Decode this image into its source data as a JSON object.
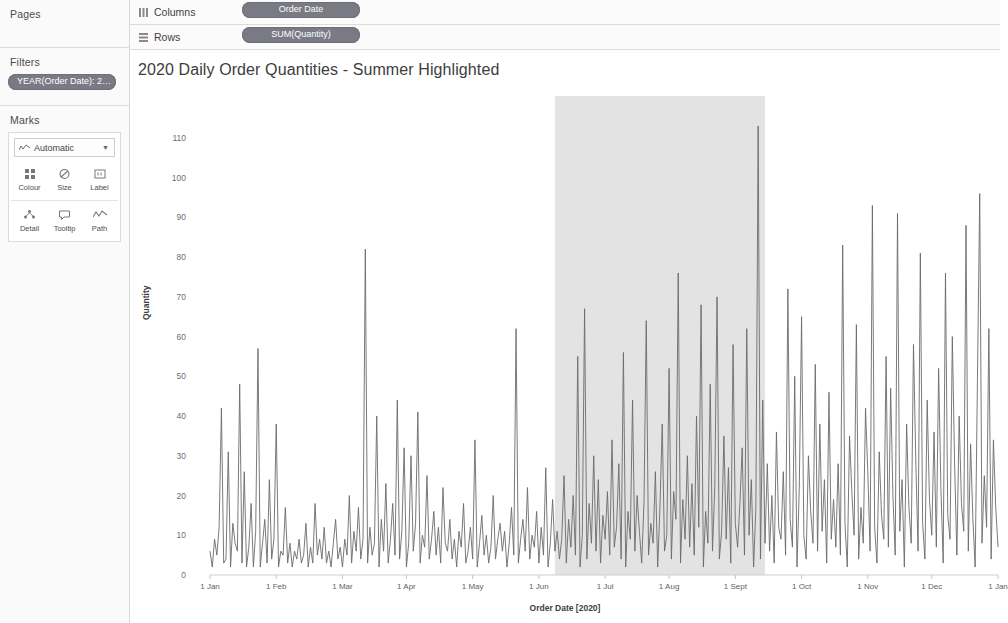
{
  "sidebar": {
    "pages": {
      "title": "Pages"
    },
    "filters": {
      "title": "Filters",
      "pills": [
        {
          "label": "YEAR(Order Date): 2…"
        }
      ]
    },
    "marks": {
      "title": "Marks",
      "type_selector": {
        "value": "Automatic",
        "icon": "line-mark-icon",
        "caret": "chevron-down-icon"
      },
      "buttons": [
        {
          "label": "Colour",
          "icon": "colour-icon"
        },
        {
          "label": "Size",
          "icon": "size-icon"
        },
        {
          "label": "Label",
          "icon": "label-icon"
        },
        {
          "label": "Detail",
          "icon": "detail-icon"
        },
        {
          "label": "Tooltip",
          "icon": "tooltip-icon"
        },
        {
          "label": "Path",
          "icon": "path-icon"
        }
      ]
    }
  },
  "shelves": [
    {
      "name": "Columns",
      "icon": "columns-icon",
      "pill": "Order Date"
    },
    {
      "name": "Rows",
      "icon": "rows-icon",
      "pill": "SUM(Quantity)"
    }
  ],
  "viz": {
    "title": "2020 Daily Order Quantities - Summer Highlighted",
    "band": {
      "label": "Summer",
      "start": "1 Jun",
      "end": "1 Sept",
      "color": "#e3e3e3"
    },
    "line_color": "#6b6b6b"
  },
  "chart_data": {
    "type": "line",
    "title": "2020 Daily Order Quantities - Summer Highlighted",
    "xlabel": "Order Date [2020]",
    "ylabel": "Quantity",
    "ylim": [
      0,
      115
    ],
    "yticks": [
      0,
      10,
      20,
      30,
      40,
      50,
      60,
      70,
      80,
      90,
      100,
      110
    ],
    "xticks": [
      "1 Jan",
      "1 Feb",
      "1 Mar",
      "1 Apr",
      "1 May",
      "1 Jun",
      "1 Jul",
      "1 Aug",
      "1 Sept",
      "1 Oct",
      "1 Nov",
      "1 Dec",
      "1 Jan"
    ],
    "grid": false,
    "legend": "none",
    "annotations": [
      {
        "text": "Summer",
        "x_start": "1 Jun",
        "x_end": "1 Sept",
        "type": "reference-band"
      }
    ],
    "series": [
      {
        "name": "SUM(Quantity)",
        "color": "#6b6b6b",
        "x_unit": "day-of-year",
        "values": [
          6,
          2,
          9,
          5,
          12,
          42,
          3,
          4,
          31,
          2,
          13,
          8,
          6,
          48,
          3,
          26,
          2,
          7,
          18,
          2,
          11,
          57,
          2,
          8,
          14,
          3,
          24,
          4,
          9,
          38,
          2,
          6,
          5,
          17,
          3,
          8,
          2,
          6,
          4,
          9,
          3,
          5,
          13,
          2,
          7,
          3,
          18,
          5,
          9,
          4,
          12,
          3,
          6,
          2,
          8,
          14,
          4,
          7,
          2,
          9,
          5,
          20,
          3,
          11,
          6,
          17,
          4,
          9,
          82,
          3,
          12,
          5,
          8,
          40,
          2,
          14,
          6,
          23,
          3,
          9,
          18,
          5,
          44,
          4,
          11,
          32,
          2,
          8,
          30,
          6,
          13,
          41,
          3,
          10,
          7,
          25,
          4,
          9,
          16,
          5,
          12,
          3,
          22,
          8,
          6,
          14,
          4,
          9,
          2,
          11,
          7,
          18,
          3,
          6,
          12,
          4,
          34,
          2,
          8,
          15,
          5,
          10,
          3,
          7,
          20,
          4,
          9,
          13,
          6,
          11,
          2,
          8,
          17,
          5,
          62,
          3,
          9,
          14,
          6,
          22,
          4,
          10,
          7,
          16,
          3,
          12,
          5,
          27,
          2,
          8,
          19,
          6,
          11,
          4,
          9,
          25,
          3,
          14,
          7,
          20,
          5,
          55,
          2,
          10,
          67,
          4,
          18,
          8,
          30,
          6,
          24,
          3,
          15,
          9,
          21,
          5,
          34,
          7,
          12,
          28,
          4,
          56,
          2,
          16,
          9,
          44,
          6,
          20,
          11,
          3,
          18,
          64,
          5,
          13,
          8,
          26,
          2,
          17,
          38,
          6,
          10,
          52,
          4,
          21,
          14,
          76,
          3,
          19,
          9,
          30,
          7,
          23,
          5,
          40,
          12,
          68,
          2,
          16,
          8,
          48,
          6,
          22,
          70,
          4,
          11,
          35,
          9,
          27,
          3,
          58,
          13,
          7,
          18,
          32,
          5,
          62,
          10,
          24,
          2,
          17,
          113,
          4,
          44,
          8,
          28,
          6,
          20,
          3,
          36,
          12,
          9,
          26,
          5,
          72,
          14,
          7,
          50,
          2,
          22,
          65,
          10,
          4,
          30,
          16,
          8,
          53,
          6,
          38,
          11,
          24,
          3,
          46,
          9,
          19,
          7,
          28,
          5,
          83,
          13,
          2,
          35,
          21,
          10,
          63,
          4,
          17,
          8,
          42,
          26,
          6,
          93,
          12,
          3,
          31,
          15,
          9,
          55,
          7,
          47,
          20,
          5,
          91,
          11,
          24,
          2,
          38,
          17,
          8,
          58,
          29,
          6,
          81,
          13,
          4,
          44,
          19,
          10,
          36,
          7,
          52,
          22,
          3,
          76,
          15,
          9,
          60,
          28,
          5,
          40,
          18,
          11,
          88,
          6,
          33,
          14,
          2,
          49,
          96,
          8,
          25,
          12,
          62,
          4,
          34,
          17,
          7
        ]
      }
    ]
  }
}
